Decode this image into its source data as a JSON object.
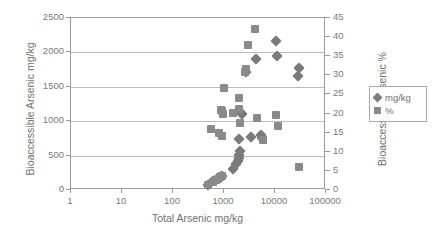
{
  "chart_data": {
    "type": "scatter",
    "title": "",
    "xlabel": "Total Arsenic mg/kg",
    "ylabel": "Bioaccessible Arsenic mg/kg",
    "y2label": "Bioaccessible Arsenic %",
    "xscale": "log",
    "xlim": [
      1,
      100000
    ],
    "ylim": [
      0,
      2500
    ],
    "y2lim": [
      0,
      45
    ],
    "grid": true,
    "legend_position": "right",
    "x_ticks": [
      "1",
      "10",
      "100",
      "1000",
      "10000",
      "100000"
    ],
    "x_tick_values": [
      1,
      10,
      100,
      1000,
      10000,
      100000
    ],
    "y_ticks": [
      "0",
      "500",
      "1000",
      "1500",
      "2000",
      "2500"
    ],
    "y_tick_values": [
      0,
      500,
      1000,
      1500,
      2000,
      2500
    ],
    "y2_ticks": [
      "0",
      "5",
      "10",
      "15",
      "20",
      "25",
      "30",
      "35",
      "40",
      "45"
    ],
    "y2_tick_values": [
      0,
      5,
      10,
      15,
      20,
      25,
      30,
      35,
      40,
      45
    ],
    "series": [
      {
        "name": "mg/kg",
        "marker": "diamond",
        "color": "#7b7b7b",
        "axis": "left",
        "points": [
          {
            "x": 480,
            "y": 75
          },
          {
            "x": 600,
            "y": 130
          },
          {
            "x": 700,
            "y": 150
          },
          {
            "x": 760,
            "y": 175
          },
          {
            "x": 820,
            "y": 185
          },
          {
            "x": 880,
            "y": 195
          },
          {
            "x": 930,
            "y": 200
          },
          {
            "x": 1500,
            "y": 310
          },
          {
            "x": 1750,
            "y": 380
          },
          {
            "x": 1850,
            "y": 420
          },
          {
            "x": 1950,
            "y": 470
          },
          {
            "x": 2000,
            "y": 510
          },
          {
            "x": 2050,
            "y": 560
          },
          {
            "x": 2000,
            "y": 740
          },
          {
            "x": 2150,
            "y": 1125
          },
          {
            "x": 2250,
            "y": 1110
          },
          {
            "x": 3400,
            "y": 775
          },
          {
            "x": 5400,
            "y": 800
          },
          {
            "x": 5600,
            "y": 760
          },
          {
            "x": 2750,
            "y": 1710
          },
          {
            "x": 4300,
            "y": 1900
          },
          {
            "x": 10500,
            "y": 2165
          },
          {
            "x": 11000,
            "y": 1950
          },
          {
            "x": 28000,
            "y": 1655
          },
          {
            "x": 30000,
            "y": 1780
          }
        ]
      },
      {
        "name": "%",
        "marker": "square",
        "color": "#8a8a8a",
        "axis": "right",
        "points": [
          {
            "x": 480,
            "y": 1.4
          },
          {
            "x": 620,
            "y": 2.2
          },
          {
            "x": 700,
            "y": 2.6
          },
          {
            "x": 760,
            "y": 3.0
          },
          {
            "x": 850,
            "y": 3.4
          },
          {
            "x": 930,
            "y": 3.6
          },
          {
            "x": 560,
            "y": 16.0
          },
          {
            "x": 800,
            "y": 14.8
          },
          {
            "x": 900,
            "y": 14.2
          },
          {
            "x": 870,
            "y": 21.0
          },
          {
            "x": 900,
            "y": 20.6
          },
          {
            "x": 950,
            "y": 20.0
          },
          {
            "x": 1000,
            "y": 26.8
          },
          {
            "x": 1500,
            "y": 20.2
          },
          {
            "x": 1950,
            "y": 21.3
          },
          {
            "x": 2000,
            "y": 24.2
          },
          {
            "x": 2050,
            "y": 17.5
          },
          {
            "x": 2600,
            "y": 30.8
          },
          {
            "x": 2750,
            "y": 31.6
          },
          {
            "x": 3000,
            "y": 38.0
          },
          {
            "x": 4100,
            "y": 42.0
          },
          {
            "x": 4400,
            "y": 18.9
          },
          {
            "x": 5800,
            "y": 13.1
          },
          {
            "x": 10500,
            "y": 19.6
          },
          {
            "x": 11500,
            "y": 16.7
          },
          {
            "x": 29000,
            "y": 6.1
          }
        ]
      }
    ]
  }
}
